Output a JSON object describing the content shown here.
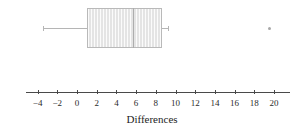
{
  "figure": {
    "type": "boxplot-figure",
    "background_color": "#ffffff",
    "width": 304,
    "height": 136
  },
  "axis": {
    "title": "Differences",
    "tick_labels": [
      "−4",
      "−2",
      "0",
      "2",
      "4",
      "6",
      "8",
      "10",
      "12",
      "14",
      "16",
      "18",
      "20"
    ],
    "tick_values": [
      -4,
      -2,
      0,
      2,
      4,
      6,
      8,
      10,
      12,
      14,
      16,
      18,
      20
    ],
    "line_color": "#4a4a4a",
    "range_min": -5.2,
    "range_max": 21.6
  },
  "chart_data": {
    "type": "box",
    "title": "",
    "xlabel": "Differences",
    "ylabel": "",
    "orientation": "horizontal",
    "xlim": [
      -5.2,
      21.6
    ],
    "xticks": [
      -4,
      -2,
      0,
      2,
      4,
      6,
      8,
      10,
      12,
      14,
      16,
      18,
      20
    ],
    "xticklabels": [
      "−4",
      "−2",
      "0",
      "2",
      "4",
      "6",
      "8",
      "10",
      "12",
      "14",
      "16",
      "18",
      "20"
    ],
    "grid": false,
    "legend": null,
    "series": [
      {
        "name": "Differences",
        "whisker_low": -3.5,
        "q1": 1.0,
        "median": 5.7,
        "q3": 8.6,
        "whisker_high": 9.2,
        "outliers": [
          19.5
        ],
        "box_fill": "#e4e4e4",
        "box_edge": "#b9b9b9",
        "median_color": "#adadad",
        "whisker_color": "#b5b5b5",
        "outlier_color": "#a8a8a8"
      }
    ]
  }
}
